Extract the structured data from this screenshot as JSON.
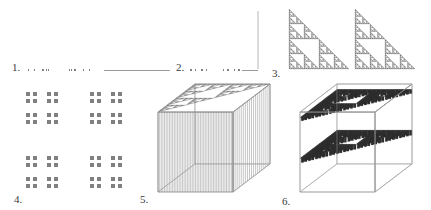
{
  "figure": {
    "caption": "",
    "background": "#ffffff",
    "ink": "#808080",
    "dark_ink": "#2f2f2f",
    "line": "#9a9a9a",
    "label_color": "#3a3a3a"
  },
  "panels": [
    {
      "id": "panel-1",
      "label": "1.",
      "label_x": 12,
      "label_y": 62,
      "title": "cantor-set-with-interval",
      "kind": "cantor-set-1d",
      "depth": 4,
      "bar_y": 69,
      "cantor": {
        "x": 28,
        "width": 62,
        "height": 2
      },
      "segment": {
        "x": 104,
        "width": 66,
        "height": 1
      }
    },
    {
      "id": "panel-2",
      "label": "2.",
      "label_x": 176,
      "label_y": 62,
      "title": "cantor-set-with-vertical-line",
      "kind": "cantor-set-1d",
      "depth": 4,
      "bar_y": 69,
      "cantor": {
        "x": 190,
        "width": 50,
        "height": 2
      },
      "segment": {
        "x": 242,
        "width": 16,
        "height": 1
      },
      "vertical_line": {
        "x": 258,
        "y": 11,
        "height": 58
      }
    },
    {
      "id": "panel-3",
      "label": "3.",
      "label_x": 272,
      "label_y": 68,
      "title": "two-sierpinski-triangles",
      "kind": "sierpinski-pair",
      "depth": 5,
      "triangles": [
        {
          "x": 289,
          "y": 9,
          "size": 60
        },
        {
          "x": 355,
          "y": 9,
          "size": 60
        }
      ]
    },
    {
      "id": "panel-4",
      "label": "4.",
      "label_x": 14,
      "label_y": 194,
      "title": "cantor-dust",
      "kind": "cantor-dust-2d",
      "depth": 3,
      "box": {
        "x": 26,
        "y": 92,
        "size": 96
      }
    },
    {
      "id": "panel-5",
      "label": "5.",
      "label_x": 140,
      "label_y": 194,
      "title": "sierpinski-prism-extruded",
      "kind": "box-3d-extrusion",
      "depth": 4,
      "box": {
        "x": 158,
        "y": 84,
        "w": 112,
        "h": 108
      }
    },
    {
      "id": "panel-6",
      "label": "6.",
      "label_x": 282,
      "label_y": 196,
      "title": "two-sierpinski-slabs-in-cube",
      "kind": "box-3d-slabs",
      "depth": 5,
      "box": {
        "x": 300,
        "y": 84,
        "w": 112,
        "h": 108
      }
    }
  ]
}
